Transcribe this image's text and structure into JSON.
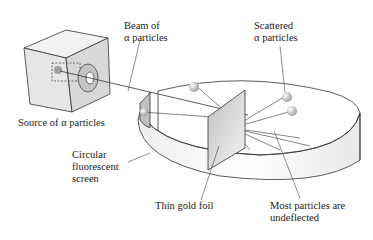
{
  "diagram": {
    "labels": {
      "beam": "Beam of\nα particles",
      "source": "Source of α particles",
      "scattered": "Scattered\nα particles",
      "screen": "Circular\nfluorescent\nscreen",
      "foil": "Thin gold foil",
      "undeflected": "Most particles are\nundeflected"
    },
    "colors": {
      "line": "#333333",
      "box_front": "#e6e6e6",
      "box_top": "#f2f2f2",
      "box_side": "#d0d0d0",
      "ring": "#bdbdbd",
      "foil": "#d9d9d9",
      "particle": "#a8a8a8"
    }
  }
}
